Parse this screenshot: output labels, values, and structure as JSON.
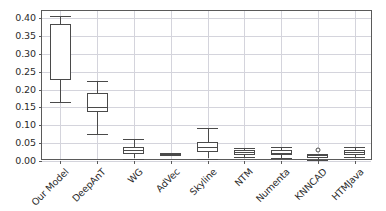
{
  "chart_data": {
    "type": "box",
    "title": "",
    "xlabel": "",
    "ylabel": "",
    "ylim": [
      0.0,
      0.42
    ],
    "ytick_labels": [
      "0.00",
      "0.05",
      "0.10",
      "0.15",
      "0.20",
      "0.25",
      "0.30",
      "0.35",
      "0.40"
    ],
    "ytick_values": [
      0.0,
      0.05,
      0.1,
      0.15,
      0.2,
      0.25,
      0.3,
      0.35,
      0.4
    ],
    "grid": true,
    "legend": "none",
    "categories": [
      "Our Model",
      "DeepAnT",
      "WG",
      "AdVec",
      "Skyline",
      "NTM",
      "Numenta",
      "KNNCAD",
      "HTMJava"
    ],
    "boxes": [
      {
        "label": "Our Model",
        "whisker_low": 0.165,
        "q1": 0.227,
        "median": 0.229,
        "q3": 0.383,
        "whisker_high": 0.405,
        "outliers": []
      },
      {
        "label": "DeepAnT",
        "whisker_low": 0.076,
        "q1": 0.136,
        "median": 0.152,
        "q3": 0.191,
        "whisker_high": 0.224,
        "outliers": []
      },
      {
        "label": "WG",
        "whisker_low": 0.007,
        "q1": 0.02,
        "median": 0.03,
        "q3": 0.04,
        "whisker_high": 0.061,
        "outliers": []
      },
      {
        "label": "AdVec",
        "whisker_low": 0.016,
        "q1": 0.018,
        "median": 0.019,
        "q3": 0.021,
        "whisker_high": 0.023,
        "outliers": []
      },
      {
        "label": "Skyline",
        "whisker_low": 0.007,
        "q1": 0.024,
        "median": 0.04,
        "q3": 0.053,
        "whisker_high": 0.093,
        "outliers": []
      },
      {
        "label": "NTM",
        "whisker_low": 0.01,
        "q1": 0.017,
        "median": 0.024,
        "q3": 0.03,
        "whisker_high": 0.037,
        "outliers": []
      },
      {
        "label": "Numenta",
        "whisker_low": 0.009,
        "q1": 0.016,
        "median": 0.023,
        "q3": 0.031,
        "whisker_high": 0.04,
        "outliers": []
      },
      {
        "label": "KNNCAD",
        "whisker_low": 0.003,
        "q1": 0.008,
        "median": 0.011,
        "q3": 0.016,
        "whisker_high": 0.02,
        "outliers": [
          0.031
        ]
      },
      {
        "label": "HTMJava",
        "whisker_low": 0.012,
        "q1": 0.018,
        "median": 0.026,
        "q3": 0.031,
        "whisker_high": 0.039,
        "outliers": []
      }
    ],
    "colors": {
      "box_edge": "#4a4a4a",
      "grid": "#d4d4dc",
      "axis": "#5a5a5a",
      "text": "#2b2b2b",
      "background": "#ffffff"
    }
  }
}
